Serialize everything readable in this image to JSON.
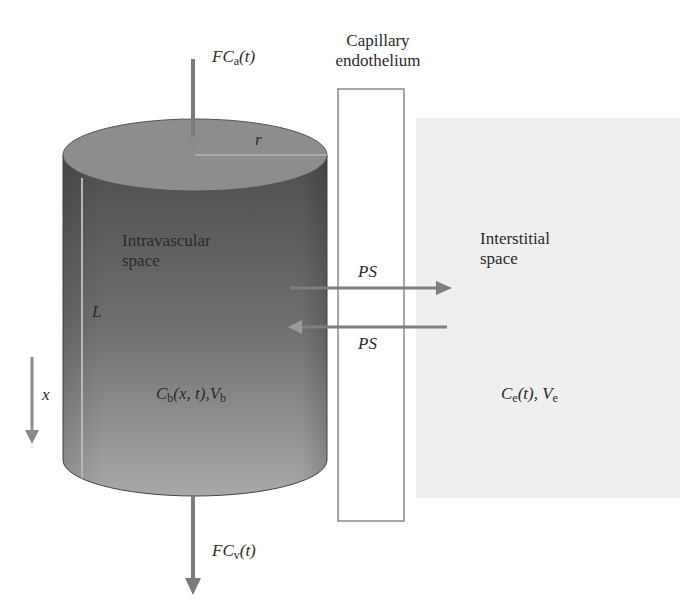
{
  "diagram": {
    "inflow_label": {
      "main": "FC",
      "sub": "a",
      "arg": "(t)"
    },
    "outflow_label": {
      "main": "FC",
      "sub": "v",
      "arg": "(t)"
    },
    "endothelium_label": [
      "Capillary",
      "endothelium"
    ],
    "radius_label": "r",
    "length_label": "L",
    "axis_label": "x",
    "intravascular": {
      "title": [
        "Intravascular",
        "space"
      ],
      "conc": {
        "c": "C",
        "c_sub": "b",
        "args": "(x, t),",
        "v": "V",
        "v_sub": "b"
      }
    },
    "interstitial": {
      "title": [
        "Interstitial",
        "space"
      ],
      "conc": {
        "c": "C",
        "c_sub": "e",
        "args": "(t), ",
        "v": "V",
        "v_sub": "e"
      }
    },
    "ps_out_label": "PS",
    "ps_in_label": "PS",
    "colors": {
      "cylinder_top": "#8c8c8c",
      "cylinder_body_dark": "#555555",
      "cylinder_body_light": "#a5a5a5",
      "arrow": "#7a7a7a",
      "interstitial_bg": "#efefef",
      "endothelium_border": "#8a8a8a"
    }
  }
}
